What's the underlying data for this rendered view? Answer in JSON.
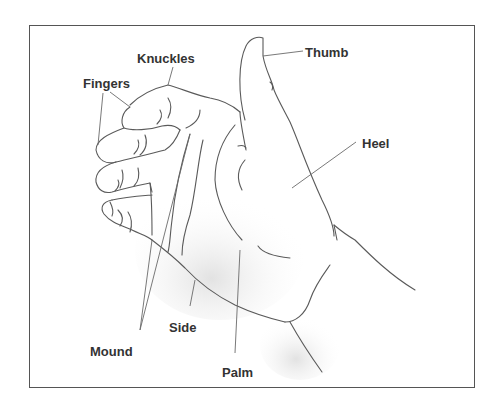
{
  "figure": {
    "labels": [
      {
        "id": "thumb",
        "text": "Thumb"
      },
      {
        "id": "knuckles",
        "text": "Knuckles"
      },
      {
        "id": "fingers",
        "text": "Fingers"
      },
      {
        "id": "heel",
        "text": "Heel"
      },
      {
        "id": "mound",
        "text": "Mound"
      },
      {
        "id": "side",
        "text": "Side"
      },
      {
        "id": "palm",
        "text": "Palm"
      }
    ]
  },
  "colors": {
    "frame": "#555555",
    "outline": "#555555",
    "leader": "#666666",
    "label": "#333333",
    "shading": "#e6e6e6"
  }
}
